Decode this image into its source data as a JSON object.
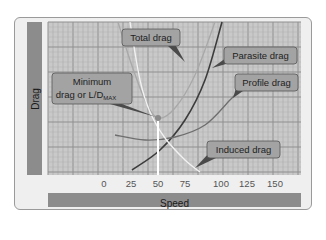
{
  "chart_data": {
    "type": "line",
    "title": "",
    "xlabel": "Speed",
    "ylabel": "Drag",
    "x_ticks": [
      "0",
      "25",
      "50",
      "75",
      "100",
      "125",
      "150"
    ],
    "xlim": [
      -35,
      170
    ],
    "grid": true,
    "series": [
      {
        "name": "Total drag",
        "color": "#a8a8a8",
        "points_px": [
          [
            118,
            22
          ],
          [
            130,
            60
          ],
          [
            145,
            100
          ],
          [
            158,
            118
          ],
          [
            175,
            108
          ],
          [
            195,
            75
          ],
          [
            215,
            22
          ]
        ]
      },
      {
        "name": "Parasite drag",
        "color": "#3c3c3c",
        "points_px": [
          [
            132,
            170
          ],
          [
            160,
            150
          ],
          [
            185,
            120
          ],
          [
            205,
            80
          ],
          [
            222,
            22
          ]
        ]
      },
      {
        "name": "Profile drag",
        "color": "#6e6e6e",
        "points_px": [
          [
            115,
            135
          ],
          [
            145,
            140
          ],
          [
            175,
            137
          ],
          [
            205,
            125
          ],
          [
            230,
            100
          ],
          [
            240,
            90
          ]
        ]
      },
      {
        "name": "Induced drag",
        "color": "#f2f2f2",
        "points_px": [
          [
            130,
            22
          ],
          [
            140,
            80
          ],
          [
            150,
            112
          ],
          [
            165,
            138
          ],
          [
            185,
            160
          ],
          [
            200,
            172
          ]
        ]
      }
    ],
    "annotations": [
      {
        "label": "Total drag",
        "x": 122,
        "y": 29,
        "w": 58,
        "h": 17
      },
      {
        "label": "Parasite drag",
        "x": 224,
        "y": 47,
        "w": 73,
        "h": 17
      },
      {
        "label": "Profile drag",
        "x": 235,
        "y": 74,
        "w": 63,
        "h": 17
      },
      {
        "label": "Minimum",
        "label2": "drag or L/D",
        "sub": "MAX",
        "x": 52,
        "y": 73,
        "w": 80,
        "h": 31
      },
      {
        "label": "Induced drag",
        "x": 207,
        "y": 141,
        "w": 73,
        "h": 17
      }
    ],
    "minimum_point": {
      "x_speed": 50,
      "px": [
        158,
        118
      ]
    }
  }
}
